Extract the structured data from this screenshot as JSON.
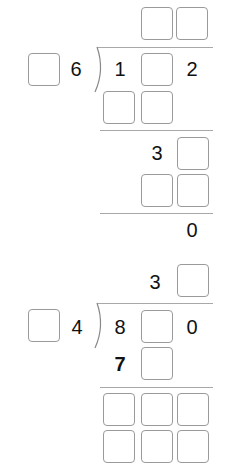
{
  "problems": [
    {
      "quotient": {
        "tens_blank": "",
        "ones_blank": ""
      },
      "divisor": {
        "tens_blank": "",
        "ones": "6"
      },
      "dividend": {
        "hundreds": "1",
        "tens_blank": "",
        "ones": "2"
      },
      "step1": {
        "hundreds_blank": "",
        "tens_blank": ""
      },
      "step2": {
        "tens": "3",
        "ones_blank": ""
      },
      "step3": {
        "tens_blank": "",
        "ones_blank": ""
      },
      "remainder": "0"
    },
    {
      "quotient": {
        "tens": "3",
        "ones_blank": ""
      },
      "divisor": {
        "tens_blank": "",
        "ones": "4"
      },
      "dividend": {
        "hundreds": "8",
        "tens_blank": "",
        "ones": "0"
      },
      "step1": {
        "hundreds": "7",
        "tens_blank": ""
      },
      "step2": {
        "hundreds_blank": "",
        "tens_blank": "",
        "ones_blank": ""
      },
      "step3": {
        "hundreds_blank": "",
        "tens_blank": "",
        "ones_blank": ""
      }
    }
  ],
  "colors": {
    "text": "#111111",
    "box_border": "#9a9a9a",
    "rule": "#a8a8a8",
    "background": "#ffffff"
  }
}
